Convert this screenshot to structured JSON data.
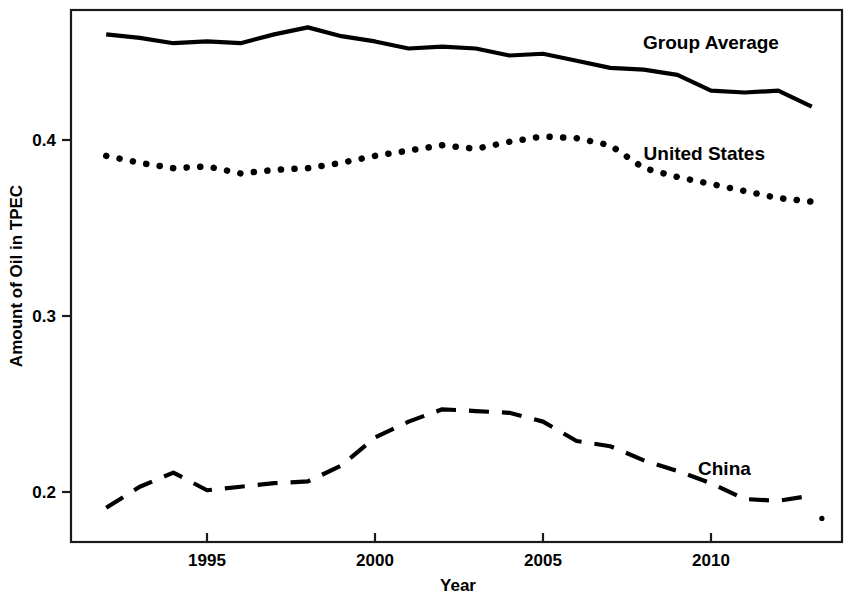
{
  "chart_data": {
    "type": "line",
    "title": "",
    "xlabel": "Year",
    "ylabel": "Amount of Oil in TPEC",
    "xlim": [
      1991.5,
      2013.6
    ],
    "ylim": [
      0.178,
      0.472
    ],
    "grid": false,
    "legend": "inline-labels",
    "xticks": [
      1995,
      2000,
      2005,
      2010
    ],
    "xtick_labels": [
      "1995",
      "2000",
      "2005",
      "2010"
    ],
    "yticks": [
      0.2,
      0.3,
      0.4
    ],
    "ytick_labels": [
      "0.2",
      "0.3",
      "0.4"
    ],
    "x": [
      1992,
      1993,
      1994,
      1995,
      1996,
      1997,
      1998,
      1999,
      2000,
      2001,
      2002,
      2003,
      2004,
      2005,
      2006,
      2007,
      2008,
      2009,
      2010,
      2011,
      2012,
      2013
    ],
    "series": [
      {
        "name": "Group Average",
        "style": "solid",
        "color": "#000000",
        "label_x": 2010.0,
        "label_y": 0.455,
        "values": [
          0.46,
          0.458,
          0.455,
          0.456,
          0.455,
          0.46,
          0.464,
          0.459,
          0.456,
          0.452,
          0.453,
          0.452,
          0.448,
          0.449,
          0.445,
          0.441,
          0.44,
          0.437,
          0.428,
          0.427,
          0.428,
          0.419
        ]
      },
      {
        "name": "United States",
        "style": "dotted",
        "color": "#000000",
        "label_x": 2009.8,
        "label_y": 0.392,
        "values": [
          0.391,
          0.387,
          0.384,
          0.385,
          0.381,
          0.383,
          0.384,
          0.387,
          0.391,
          0.394,
          0.397,
          0.395,
          0.399,
          0.402,
          0.401,
          0.397,
          0.384,
          0.379,
          0.375,
          0.371,
          0.367,
          0.365
        ]
      },
      {
        "name": "China",
        "style": "dashed",
        "color": "#000000",
        "label_x": 2010.4,
        "label_y": 0.213,
        "values": [
          0.191,
          0.203,
          0.211,
          0.201,
          0.203,
          0.205,
          0.206,
          0.215,
          0.231,
          0.24,
          0.247,
          0.246,
          0.245,
          0.24,
          0.229,
          0.226,
          0.218,
          0.212,
          0.205,
          0.196,
          0.195,
          0.198
        ]
      }
    ],
    "series_final_point": {
      "name": "China",
      "x": 2013.3,
      "y": 0.185
    }
  }
}
